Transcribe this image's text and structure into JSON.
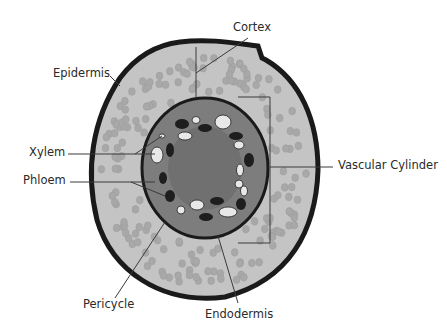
{
  "diagram": {
    "colors": {
      "outline": "#1a1a1a",
      "cortex_fill": "#c4c4c4",
      "cortex_cell": "#a6a6a6",
      "stele_fill": "#7d7d7d",
      "pith_fill": "#6f6f6f",
      "xylem_fill": "#e6e6e6",
      "phloem_fill": "#1e1e1e",
      "label_line": "#3a3a3a"
    },
    "labels": {
      "cortex": "Cortex",
      "epidermis": "Epidermis",
      "xylem": "Xylem",
      "phloem": "Phloem",
      "vascular_cylinder": "Vascular Cylinder",
      "pericycle": "Pericycle",
      "endodermis": "Endodermis"
    }
  }
}
